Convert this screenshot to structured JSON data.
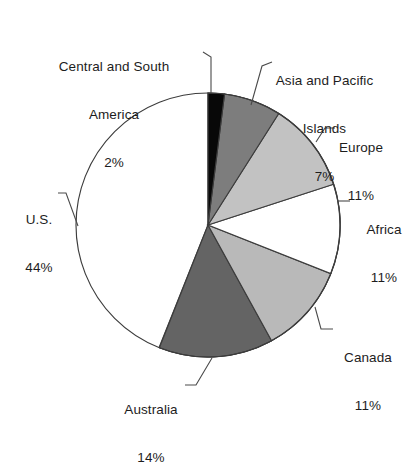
{
  "chart_data": {
    "type": "pie",
    "title": "",
    "subtitle": "",
    "xlabel": "",
    "ylabel": "",
    "legend_position": "none",
    "grid": false,
    "value_unit": "%",
    "categories": [
      "Central and South America",
      "Asia and Pacific Islands",
      "Europe",
      "Africa",
      "Canada",
      "Australia",
      "U.S."
    ],
    "values": [
      2,
      7,
      11,
      11,
      11,
      14,
      44
    ],
    "slices": [
      {
        "name": "Central and South America",
        "label_line1": "Central and South",
        "label_line2": "America",
        "value": 2,
        "value_label": "2%",
        "color": "#080808",
        "start_angle_deg": 0,
        "end_angle_deg": 7.2
      },
      {
        "name": "Asia and Pacific Islands",
        "label_line1": "Asia and Pacific",
        "label_line2": "Islands",
        "value": 7,
        "value_label": "7%",
        "color": "#7d7d7d",
        "start_angle_deg": 7.2,
        "end_angle_deg": 32.4
      },
      {
        "name": "Europe",
        "label_line1": "Europe",
        "label_line2": "",
        "value": 11,
        "value_label": "11%",
        "color": "#c2c2c2",
        "start_angle_deg": 32.4,
        "end_angle_deg": 72.0
      },
      {
        "name": "Africa",
        "label_line1": "Africa",
        "label_line2": "",
        "value": 11,
        "value_label": "11%",
        "color": "#ffffff",
        "start_angle_deg": 72.0,
        "end_angle_deg": 111.6
      },
      {
        "name": "Canada",
        "label_line1": "Canada",
        "label_line2": "",
        "value": 11,
        "value_label": "11%",
        "color": "#b9b9b9",
        "start_angle_deg": 111.6,
        "end_angle_deg": 151.2
      },
      {
        "name": "Australia",
        "label_line1": "Australia",
        "label_line2": "",
        "value": 14,
        "value_label": "14%",
        "color": "#646464",
        "start_angle_deg": 151.2,
        "end_angle_deg": 201.6
      },
      {
        "name": "U.S.",
        "label_line1": "U.S.",
        "label_line2": "",
        "value": 44,
        "value_label": "44%",
        "color": "#ffffff",
        "start_angle_deg": 201.6,
        "end_angle_deg": 360.0
      }
    ],
    "geometry": {
      "center_x": 208,
      "center_y": 225,
      "radius": 132,
      "start_at_twelve_oclock": true,
      "direction": "clockwise"
    },
    "colors": {
      "outline": "#3c3c3c",
      "leader_line": "#4a4a4a",
      "background": "#ffffff",
      "text": "#1d1d1d"
    }
  }
}
